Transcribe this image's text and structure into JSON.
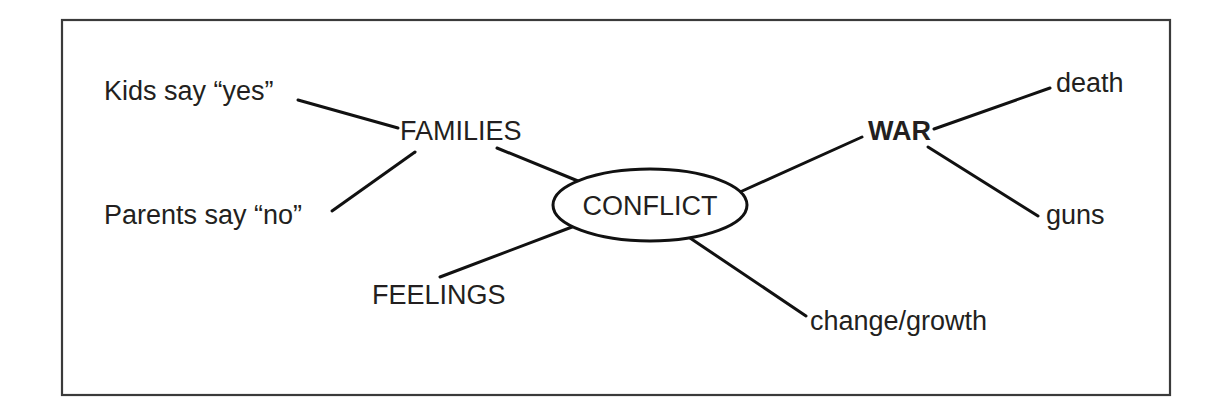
{
  "diagram": {
    "type": "mind-map",
    "frame": {
      "x": 62,
      "y": 20,
      "width": 1108,
      "height": 375,
      "border_color": "#3a3a3a",
      "background_color": "#ffffff"
    },
    "style": {
      "line_color": "#111111",
      "text_color": "#231f20",
      "line_width": 3
    },
    "central_node": {
      "label": "CONFLICT",
      "shape": "ellipse",
      "cx": 650,
      "cy": 205,
      "rx": 97,
      "ry": 36,
      "text_x": 650,
      "text_y": 215
    },
    "nodes": [
      {
        "id": "families",
        "label": "FAMILIES",
        "level": "branch",
        "emphasis": false,
        "text_x": 400,
        "text_y": 140,
        "anchor": "start"
      },
      {
        "id": "kids-say-yes",
        "label": "Kids say “yes”",
        "level": "leaf",
        "emphasis": false,
        "text_x": 104,
        "text_y": 100,
        "anchor": "start"
      },
      {
        "id": "parents-say-no",
        "label": "Parents say “no”",
        "level": "leaf",
        "emphasis": false,
        "text_x": 104,
        "text_y": 224,
        "anchor": "start"
      },
      {
        "id": "feelings",
        "label": "FEELINGS",
        "level": "branch",
        "emphasis": false,
        "text_x": 372,
        "text_y": 304,
        "anchor": "start"
      },
      {
        "id": "war",
        "label": "WAR",
        "level": "branch",
        "emphasis": true,
        "text_x": 868,
        "text_y": 140,
        "anchor": "start"
      },
      {
        "id": "death",
        "label": "death",
        "level": "leaf",
        "emphasis": false,
        "text_x": 1056,
        "text_y": 92,
        "anchor": "start"
      },
      {
        "id": "guns",
        "label": "guns",
        "level": "leaf",
        "emphasis": false,
        "text_x": 1046,
        "text_y": 224,
        "anchor": "start"
      },
      {
        "id": "change-growth",
        "label": "change/growth",
        "level": "leaf",
        "emphasis": false,
        "text_x": 810,
        "text_y": 330,
        "anchor": "start"
      }
    ],
    "edges": [
      {
        "id": "edge-kids-families",
        "from": "kids-say-yes",
        "to": "families",
        "x1": 298,
        "y1": 100,
        "x2": 398,
        "y2": 128
      },
      {
        "id": "edge-parents-families",
        "from": "parents-say-no",
        "to": "families",
        "x1": 332,
        "y1": 211,
        "x2": 415,
        "y2": 152
      },
      {
        "id": "edge-families-conflict",
        "from": "families",
        "to": "conflict",
        "x1": 497,
        "y1": 148,
        "x2": 578,
        "y2": 181
      },
      {
        "id": "edge-feelings-conflict",
        "from": "feelings",
        "to": "conflict",
        "x1": 440,
        "y1": 277,
        "x2": 572,
        "y2": 227
      },
      {
        "id": "edge-conflict-war",
        "from": "conflict",
        "to": "war",
        "x1": 740,
        "y1": 192,
        "x2": 862,
        "y2": 137
      },
      {
        "id": "edge-war-death",
        "from": "war",
        "to": "death",
        "x1": 934,
        "y1": 129,
        "x2": 1050,
        "y2": 88
      },
      {
        "id": "edge-war-guns",
        "from": "war",
        "to": "guns",
        "x1": 928,
        "y1": 147,
        "x2": 1038,
        "y2": 216
      },
      {
        "id": "edge-conflict-change",
        "from": "conflict",
        "to": "change-growth",
        "x1": 690,
        "y1": 238,
        "x2": 806,
        "y2": 316
      }
    ]
  }
}
